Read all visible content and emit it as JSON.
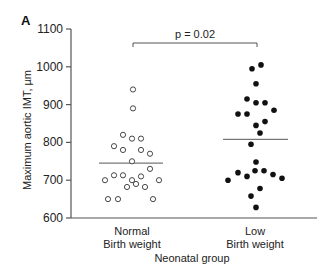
{
  "panel_label": "A",
  "chart_data": {
    "type": "scatter",
    "subtype": "dot-strip-plot",
    "title": "",
    "xlabel": "Neonatal group",
    "ylabel": "Maximum aortic IMT, µm",
    "ylim": [
      600,
      1100
    ],
    "yticks": [
      600,
      700,
      800,
      900,
      1000,
      1100
    ],
    "grid": false,
    "legend": null,
    "categories": [
      "Normal\nBirth weight",
      "Low\nBirth weight"
    ],
    "category_lines": [
      [
        "Normal",
        "Birth weight"
      ],
      [
        "Low",
        "Birth weight"
      ]
    ],
    "annotation": {
      "type": "bracket",
      "text": "p = 0.02",
      "between": [
        "Normal Birth weight",
        "Low Birth weight"
      ]
    },
    "series": [
      {
        "name": "Normal Birth weight",
        "marker": "open-circle",
        "mean": 745,
        "points": [
          {
            "x": 133,
            "v": 940
          },
          {
            "x": 133,
            "v": 890
          },
          {
            "x": 123,
            "v": 820
          },
          {
            "x": 132,
            "v": 810
          },
          {
            "x": 141,
            "v": 810
          },
          {
            "x": 114,
            "v": 790
          },
          {
            "x": 123,
            "v": 780
          },
          {
            "x": 141,
            "v": 780
          },
          {
            "x": 150,
            "v": 770
          },
          {
            "x": 132,
            "v": 750
          },
          {
            "x": 150,
            "v": 730
          },
          {
            "x": 105,
            "v": 700
          },
          {
            "x": 114,
            "v": 713
          },
          {
            "x": 123,
            "v": 713
          },
          {
            "x": 132,
            "v": 700
          },
          {
            "x": 141,
            "v": 710
          },
          {
            "x": 159,
            "v": 700
          },
          {
            "x": 127,
            "v": 682
          },
          {
            "x": 136,
            "v": 690
          },
          {
            "x": 145,
            "v": 682
          },
          {
            "x": 108,
            "v": 650
          },
          {
            "x": 118,
            "v": 650
          },
          {
            "x": 153,
            "v": 650
          }
        ]
      },
      {
        "name": "Low Birth weight",
        "marker": "filled-circle",
        "mean": 808,
        "points": [
          {
            "x": 261,
            "v": 1005
          },
          {
            "x": 252,
            "v": 995
          },
          {
            "x": 256,
            "v": 955
          },
          {
            "x": 247,
            "v": 915
          },
          {
            "x": 256,
            "v": 905
          },
          {
            "x": 265,
            "v": 905
          },
          {
            "x": 274,
            "v": 885
          },
          {
            "x": 238,
            "v": 875
          },
          {
            "x": 247,
            "v": 875
          },
          {
            "x": 265,
            "v": 855
          },
          {
            "x": 256,
            "v": 845
          },
          {
            "x": 260,
            "v": 825
          },
          {
            "x": 251,
            "v": 795
          },
          {
            "x": 256,
            "v": 748
          },
          {
            "x": 255,
            "v": 725
          },
          {
            "x": 264,
            "v": 725
          },
          {
            "x": 238,
            "v": 720
          },
          {
            "x": 273,
            "v": 715
          },
          {
            "x": 247,
            "v": 710
          },
          {
            "x": 282,
            "v": 705
          },
          {
            "x": 228,
            "v": 700
          },
          {
            "x": 260,
            "v": 678
          },
          {
            "x": 251,
            "v": 658
          },
          {
            "x": 256,
            "v": 628
          }
        ]
      }
    ]
  },
  "colors": {
    "axis": "#555555",
    "mean_line": "#777777",
    "point_fill_low": "#111111",
    "point_stroke_normal": "#333333",
    "text": "#222222"
  },
  "layout": {
    "y_axis_x": 71,
    "x_axis_y": 218,
    "x_axis_end": 317,
    "y_top_px": 29,
    "y_bottom_px": 218,
    "mean_line_spans": [
      [
        99,
        163
      ],
      [
        223,
        288
      ]
    ],
    "bracket": {
      "x1": 133,
      "x2": 257,
      "y": 43,
      "tick_down": 4
    },
    "category_centers": [
      132,
      255
    ]
  }
}
